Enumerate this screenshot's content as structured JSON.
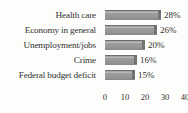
{
  "chart_data": {
    "type": "bar",
    "orientation": "horizontal",
    "title": "",
    "subtitle": "",
    "xlabel": "",
    "ylabel": "",
    "categories": [
      "Health care",
      "Economy in general",
      "Unemployment/jobs",
      "Crime",
      "Federal budget deficit"
    ],
    "values": [
      28,
      26,
      20,
      16,
      15
    ],
    "value_labels": [
      "28%",
      "26%",
      "20%",
      "16%",
      "15%"
    ],
    "xlim": [
      0,
      40
    ],
    "xticks": [
      0,
      10,
      20,
      30,
      40
    ],
    "xtick_labels": [
      "0",
      "10",
      "20",
      "30",
      "40"
    ],
    "grid": false,
    "legend": null,
    "bar_color": "#9a9a9a",
    "bar_edge_color": "#6f6f6f",
    "background_color": "#fdfdfb",
    "text_color": "#2e2e2e"
  },
  "top_bleed": {
    "text": ""
  }
}
